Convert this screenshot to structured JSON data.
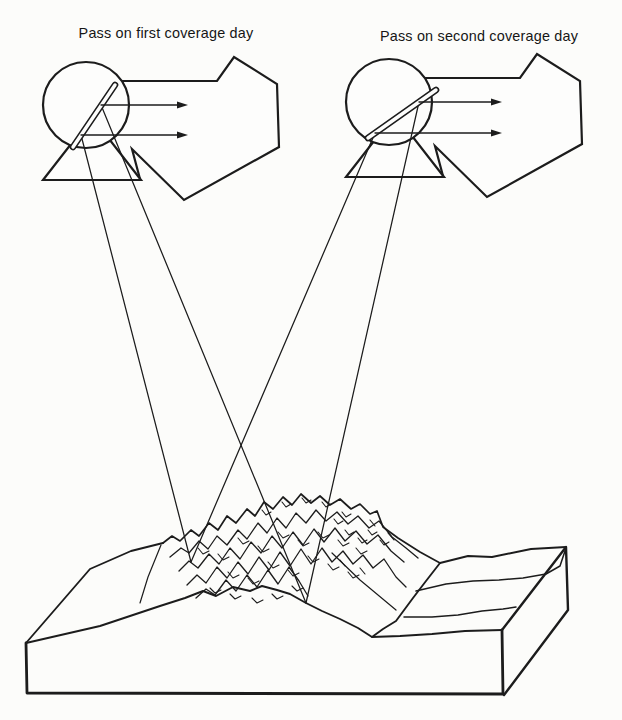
{
  "figure": {
    "labels": {
      "left": "Pass on first coverage day",
      "right": "Pass on second coverage day"
    },
    "icons": {
      "left": "satellite-scanner-icon",
      "right": "satellite-scanner-icon"
    },
    "colors": {
      "ink": "#1c1c1c",
      "paper": "#fcfcfa"
    }
  }
}
